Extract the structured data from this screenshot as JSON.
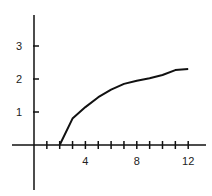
{
  "chart_data": {
    "type": "line",
    "title": "",
    "xlabel": "",
    "ylabel": "",
    "x_ticks": [
      1,
      2,
      3,
      4,
      5,
      6,
      7,
      8,
      9,
      10,
      11,
      12
    ],
    "x_tick_labels": [
      "4",
      "8",
      "12"
    ],
    "x_tick_label_values": [
      4,
      8,
      12
    ],
    "y_ticks": [
      1,
      2,
      3
    ],
    "y_tick_labels": [
      "1",
      "2",
      "3"
    ],
    "xlim": [
      -1,
      13
    ],
    "ylim": [
      -1.4,
      4
    ],
    "grid": false,
    "legend": null,
    "series": [
      {
        "name": "curve",
        "x": [
          2,
          3,
          4,
          5,
          6,
          7,
          8,
          9,
          10,
          11,
          12
        ],
        "y": [
          0,
          0.8,
          1.15,
          1.45,
          1.68,
          1.85,
          1.95,
          2.02,
          2.12,
          2.27,
          2.3
        ]
      }
    ]
  },
  "colors": {
    "line": "#111111",
    "axis": "#111111",
    "text": "#222222"
  }
}
